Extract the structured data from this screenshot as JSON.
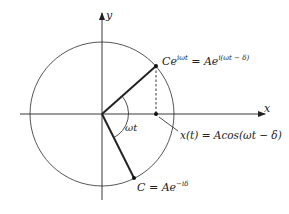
{
  "diagram": {
    "title": "",
    "axes": {
      "x_label": "x",
      "y_label": "y"
    },
    "labels": {
      "rotating_point": {
        "left": "Ce",
        "left_sup": "iωt",
        "equals": " = Ae",
        "right_sup": "i(ωt − δ)"
      },
      "projection": "x(t) = Acos(ωt − δ)",
      "initial_point": {
        "base": "C = Ae",
        "sup": "−iδ"
      },
      "angle": "ωt"
    },
    "colors": {
      "line": "#222222",
      "circle": "#444444",
      "background": "#ffffff"
    }
  }
}
